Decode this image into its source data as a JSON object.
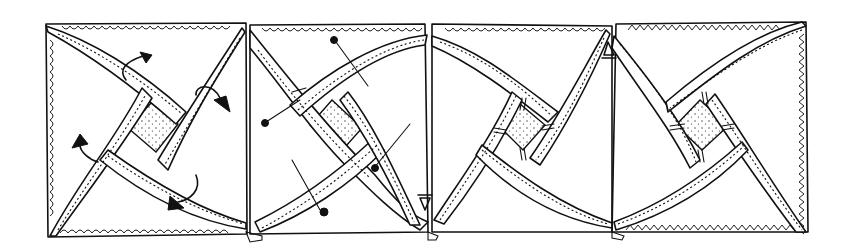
{
  "figure": {
    "ink_color": "#111111",
    "background_color": "#ffffff",
    "panels": [
      {
        "id": "block-1",
        "annotation": "curved twist arrows showing how to fold bands",
        "has_arrows": true,
        "has_pins": false
      },
      {
        "id": "block-2",
        "annotation": "pins placed along bands",
        "has_arrows": false,
        "has_pins": true
      },
      {
        "id": "block-3",
        "annotation": "tacking stitches at band crossings",
        "has_arrows": false,
        "has_pins": false
      },
      {
        "id": "block-4",
        "annotation": "tacking stitches at band crossings",
        "has_arrows": false,
        "has_pins": false
      }
    ]
  }
}
